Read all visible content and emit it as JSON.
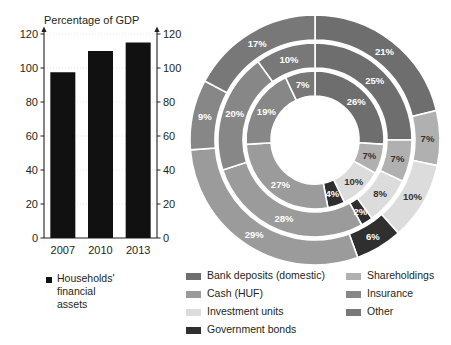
{
  "chart_data": [
    {
      "type": "bar",
      "title": "Percentage of GDP",
      "categories": [
        "2007",
        "2010",
        "2013"
      ],
      "values": [
        97.5,
        110,
        115
      ],
      "series_name": "Households' financial assets",
      "xlabel": "",
      "ylabel": "",
      "ylim": [
        0,
        120
      ],
      "yticks": [
        0,
        20,
        40,
        60,
        80,
        100,
        120
      ],
      "right_axis": true,
      "right_yticks": [
        0,
        20,
        40,
        60,
        80,
        100,
        120
      ],
      "grid": true,
      "bar_color": "#111111",
      "legend": [
        "Households' financial assets"
      ],
      "legend_position": "bottom"
    },
    {
      "type": "pie",
      "variant": "nested-donut",
      "title": "",
      "rings": [
        {
          "name": "inner",
          "labels": [
            "26%",
            "7%",
            "10%",
            "4%",
            "27%",
            "19%",
            "7%"
          ],
          "values": [
            26,
            7,
            10,
            4,
            27,
            19,
            7
          ]
        },
        {
          "name": "middle",
          "labels": [
            "25%",
            "7%",
            "8%",
            "2%",
            "28%",
            "20%",
            "10%"
          ],
          "values": [
            25,
            7,
            8,
            2,
            28,
            20,
            10
          ]
        },
        {
          "name": "outer",
          "labels": [
            "21%",
            "7%",
            "10%",
            "6%",
            "29%",
            "9%",
            "17%"
          ],
          "values": [
            21,
            7,
            10,
            6,
            29,
            9,
            17
          ]
        }
      ],
      "categories": [
        "Bank deposits (domestic)",
        "Shareholdings",
        "Investment units",
        "Government bonds",
        "Cash (HUF)",
        "Insurance",
        "Other"
      ],
      "colors": [
        "#6e6e6e",
        "#b0b0b0",
        "#dcdcdc",
        "#2f2f2f",
        "#9b9b9b",
        "#878787",
        "#787878"
      ],
      "start_angle_deg": 0,
      "direction": "clockwise",
      "legend_position": "bottom"
    }
  ],
  "bar_chart": {
    "title": "Percentage of GDP",
    "categories": [
      "2007",
      "2010",
      "2013"
    ],
    "values": [
      97.5,
      110,
      115
    ],
    "ytick_labels": [
      "0",
      "20",
      "40",
      "60",
      "80",
      "100",
      "120"
    ],
    "legend_label_line1": "Households'",
    "legend_label_line2": "financial",
    "legend_label_line3": "assets"
  },
  "donut": {
    "slice_labels": {
      "inner": [
        "26%",
        "7%",
        "10%",
        "4%",
        "27%",
        "19%",
        "7%"
      ],
      "middle": [
        "25%",
        "7%",
        "8%",
        "2%",
        "28%",
        "20%",
        "10%"
      ],
      "outer": [
        "21%",
        "7%",
        "10%",
        "6%",
        "29%",
        "9%",
        "17%"
      ]
    }
  },
  "legend": {
    "left_items": [
      {
        "label": "Bank deposits (domestic)",
        "color": "#6e6e6e"
      },
      {
        "label": "Cash (HUF)",
        "color": "#9b9b9b"
      },
      {
        "label": "Investment units",
        "color": "#dcdcdc"
      },
      {
        "label": "Government bonds",
        "color": "#2f2f2f"
      }
    ],
    "right_items": [
      {
        "label": "Shareholdings",
        "color": "#b0b0b0"
      },
      {
        "label": "Insurance",
        "color": "#878787"
      },
      {
        "label": "Other",
        "color": "#787878"
      }
    ]
  }
}
